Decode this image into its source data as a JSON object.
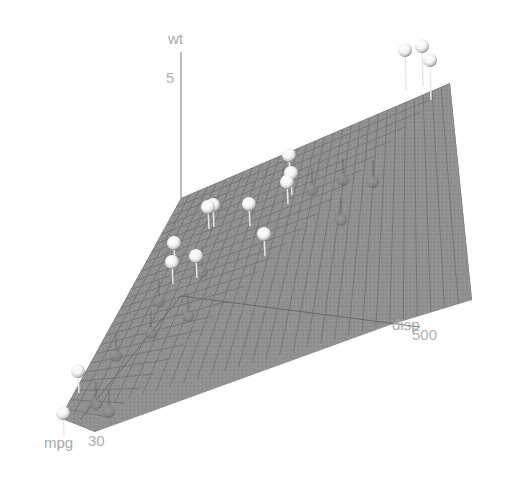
{
  "chart_data": {
    "type": "scatter3d",
    "title": "",
    "axes": {
      "x": {
        "label": "mpg",
        "ticks": [
          30
        ]
      },
      "y": {
        "label": "disp",
        "ticks": [
          500
        ]
      },
      "z": {
        "label": "wt",
        "ticks": [
          5
        ]
      }
    },
    "regression_plane": true,
    "plane_color": "#8c8c8c",
    "grid_color": "#6e6e6e",
    "point_color": "#ffffff",
    "points_screen": [
      {
        "x": 405,
        "y": 50,
        "above": true
      },
      {
        "x": 422,
        "y": 46,
        "above": true
      },
      {
        "x": 430,
        "y": 60,
        "above": true
      },
      {
        "x": 289,
        "y": 155,
        "above": true
      },
      {
        "x": 291,
        "y": 173,
        "above": true
      },
      {
        "x": 287,
        "y": 182,
        "above": true
      },
      {
        "x": 213,
        "y": 205,
        "above": true
      },
      {
        "x": 208,
        "y": 207,
        "above": true
      },
      {
        "x": 249,
        "y": 204,
        "above": true
      },
      {
        "x": 264,
        "y": 234,
        "above": true
      },
      {
        "x": 174,
        "y": 243,
        "above": true
      },
      {
        "x": 172,
        "y": 262,
        "above": true
      },
      {
        "x": 196,
        "y": 256,
        "above": true
      },
      {
        "x": 78,
        "y": 371,
        "above": true
      },
      {
        "x": 63,
        "y": 413,
        "above": true
      },
      {
        "x": 312,
        "y": 190,
        "above": false
      },
      {
        "x": 343,
        "y": 180,
        "above": false
      },
      {
        "x": 341,
        "y": 220,
        "above": false
      },
      {
        "x": 373,
        "y": 182,
        "above": false
      },
      {
        "x": 202,
        "y": 272,
        "above": false
      },
      {
        "x": 159,
        "y": 302,
        "above": false
      },
      {
        "x": 188,
        "y": 316,
        "above": false
      },
      {
        "x": 151,
        "y": 333,
        "above": false
      },
      {
        "x": 116,
        "y": 356,
        "above": false
      },
      {
        "x": 96,
        "y": 404,
        "above": false
      },
      {
        "x": 109,
        "y": 412,
        "above": false
      }
    ]
  },
  "labels": {
    "z_axis": "wt",
    "z_tick": "5",
    "x_axis": "mpg",
    "x_tick": "30",
    "y_axis": "disp",
    "y_tick": "500"
  }
}
